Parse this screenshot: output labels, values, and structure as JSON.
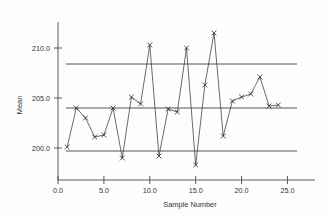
{
  "chart_data": {
    "type": "line",
    "title": "",
    "xlabel": "Sample  Number",
    "ylabel": "Mean",
    "xlim": [
      0.0,
      28.0
    ],
    "ylim": [
      196.8,
      212.6
    ],
    "grid": false,
    "legend": null,
    "x_ticks": [
      "0.0",
      "5.0",
      "10.0",
      "15.0",
      "20.0",
      "25.0"
    ],
    "x_tick_values": [
      0,
      5,
      10,
      15,
      20,
      25
    ],
    "y_ticks": [
      "200.0",
      "205.0",
      "210.0"
    ],
    "y_tick_values": [
      200.0,
      205.0,
      210.0
    ],
    "marker": "x",
    "x": [
      1,
      2,
      3,
      4,
      5,
      6,
      7,
      8,
      9,
      10,
      11,
      12,
      13,
      14,
      15,
      16,
      17,
      18,
      19,
      20,
      21,
      22,
      23,
      24
    ],
    "series": [
      {
        "name": "Mean",
        "values": [
          200.1,
          204.0,
          203.0,
          201.1,
          201.3,
          204.0,
          199.0,
          205.1,
          204.4,
          210.3,
          199.2,
          203.9,
          203.6,
          210.0,
          198.3,
          206.3,
          211.5,
          201.2,
          204.7,
          205.1,
          205.4,
          207.1,
          204.2,
          204.3
        ]
      }
    ],
    "reference_lines": [
      {
        "name": "upper-control-limit",
        "value": 208.4
      },
      {
        "name": "center-line",
        "value": 204.0
      },
      {
        "name": "lower-control-limit",
        "value": 199.7
      }
    ],
    "colors": {
      "series": "#3a3a3a",
      "limits": "#555555",
      "axis": "#4a4a4a",
      "background": "#fdfdfd"
    }
  }
}
